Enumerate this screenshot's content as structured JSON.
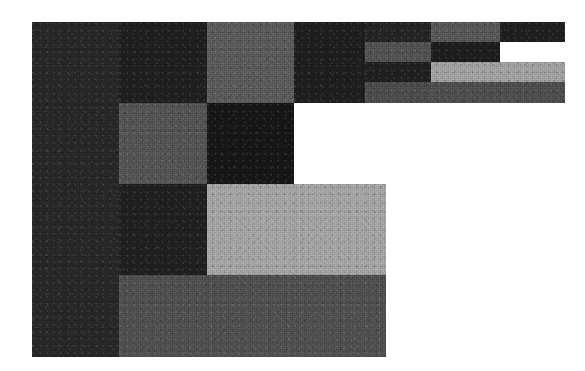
{
  "figure": {
    "title": "",
    "background_color": "#ffffff",
    "width": 585,
    "height": 371,
    "plot_origin_x": 32,
    "plot_origin_y": 22
  },
  "chart_data": {
    "type": "heatmap",
    "subtype": "mosaic-treemap",
    "title": "",
    "subtitle": "",
    "xlabel": "",
    "ylabel": "",
    "grid": false,
    "legend": false,
    "axis_ticks": [],
    "tick_labels": [],
    "annotations": [],
    "colorscale": "grayscale",
    "xlim": [
      0,
      585
    ],
    "ylim": [
      0,
      371
    ],
    "palette": {
      "very_dark": "#1b1b1b",
      "dark": "#242424",
      "dark_alt": "#2c2c2c",
      "mid_dark": "#3b3b3b",
      "mid": "#4f4f4f",
      "mid_light": "#6e6e6e",
      "gray": "#7d7d7d",
      "light": "#9d9d9d",
      "lighter": "#a9a9a9",
      "white": "#ffffff"
    },
    "cells": [
      {
        "id": "c01",
        "label": "left-column-block",
        "x": 32,
        "y": 22,
        "w": 87,
        "h": 335,
        "value": 0.22,
        "color": "#272727"
      },
      {
        "id": "c02",
        "label": "top-left-dark-block",
        "x": 119,
        "y": 22,
        "w": 88,
        "h": 81,
        "value": 0.14,
        "color": "#1f1f1f"
      },
      {
        "id": "c03",
        "label": "top-mid-gray-block",
        "x": 207,
        "y": 22,
        "w": 87,
        "h": 81,
        "value": 0.5,
        "color": "#5a5a5a"
      },
      {
        "id": "c04",
        "label": "top-right-dark-wide",
        "x": 294,
        "y": 22,
        "w": 71,
        "h": 81,
        "value": 0.12,
        "color": "#1e1e1e"
      },
      {
        "id": "c05",
        "label": "r1-col5-mid",
        "x": 365,
        "y": 22,
        "w": 66,
        "h": 20,
        "value": 0.16,
        "color": "#242424"
      },
      {
        "id": "c06",
        "label": "r1-col6-light",
        "x": 431,
        "y": 22,
        "w": 69,
        "h": 20,
        "value": 0.44,
        "color": "#575757"
      },
      {
        "id": "c07",
        "label": "r1-col7-dark",
        "x": 500,
        "y": 22,
        "w": 65,
        "h": 20,
        "value": 0.13,
        "color": "#1f1f1f"
      },
      {
        "id": "c08",
        "label": "r2-col5-gray",
        "x": 365,
        "y": 42,
        "w": 66,
        "h": 20,
        "value": 0.41,
        "color": "#525252"
      },
      {
        "id": "c09",
        "label": "r2-col6-dark",
        "x": 431,
        "y": 42,
        "w": 69,
        "h": 20,
        "value": 0.12,
        "color": "#1d1d1d"
      },
      {
        "id": "c10",
        "label": "r3-col5-dark",
        "x": 365,
        "y": 62,
        "w": 66,
        "h": 20,
        "value": 0.13,
        "color": "#202020"
      },
      {
        "id": "c11",
        "label": "r3-col6-light",
        "x": 431,
        "y": 62,
        "w": 134,
        "h": 20,
        "value": 0.68,
        "color": "#a1a1a1"
      },
      {
        "id": "c12",
        "label": "r4-col5-gray",
        "x": 365,
        "y": 82,
        "w": 66,
        "h": 21,
        "value": 0.36,
        "color": "#4c4c4c"
      },
      {
        "id": "c13",
        "label": "r4-col6-mid",
        "x": 431,
        "y": 82,
        "w": 134,
        "h": 21,
        "value": 0.36,
        "color": "#4e4e4e"
      },
      {
        "id": "c14",
        "label": "mid-left-gray-square",
        "x": 119,
        "y": 103,
        "w": 88,
        "h": 81,
        "value": 0.42,
        "color": "#545454"
      },
      {
        "id": "c15",
        "label": "mid-center-very-dark",
        "x": 207,
        "y": 103,
        "w": 87,
        "h": 81,
        "value": 0.08,
        "color": "#161616"
      },
      {
        "id": "c16",
        "label": "lower-left-dark-block",
        "x": 119,
        "y": 184,
        "w": 88,
        "h": 91,
        "value": 0.13,
        "color": "#202020"
      },
      {
        "id": "c17",
        "label": "lower-center-light-block",
        "x": 207,
        "y": 184,
        "w": 179,
        "h": 91,
        "value": 0.69,
        "color": "#a4a4a4"
      },
      {
        "id": "c18",
        "label": "bottom-wide-mid-block",
        "x": 119,
        "y": 275,
        "w": 267,
        "h": 82,
        "value": 0.38,
        "color": "#505050"
      }
    ]
  }
}
